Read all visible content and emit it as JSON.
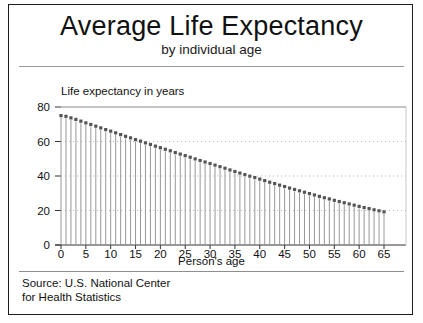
{
  "header": {
    "title": "Average Life Expectancy",
    "subtitle": "by individual age"
  },
  "source_note": "Source: U.S. National Center\nfor Health Statistics",
  "chart_data": {
    "type": "bar",
    "title": "Average Life Expectancy",
    "subtitle": "by individual age",
    "xlabel": "Person's age",
    "ylabel": "Life expectancy in years",
    "xlim": [
      0,
      67
    ],
    "ylim": [
      0,
      80
    ],
    "xticks": [
      0,
      5,
      10,
      15,
      20,
      25,
      30,
      35,
      40,
      45,
      50,
      55,
      60,
      65
    ],
    "yticks": [
      0,
      20,
      40,
      60,
      80
    ],
    "grid": "horizontal-dotted",
    "legend": "none",
    "marker": "square",
    "marker_color": "#555555",
    "line_color": "#8c8c8c",
    "categories": [
      0,
      1,
      2,
      3,
      4,
      5,
      6,
      7,
      8,
      9,
      10,
      11,
      12,
      13,
      14,
      15,
      16,
      17,
      18,
      19,
      20,
      21,
      22,
      23,
      24,
      25,
      26,
      27,
      28,
      29,
      30,
      31,
      32,
      33,
      34,
      35,
      36,
      37,
      38,
      39,
      40,
      41,
      42,
      43,
      44,
      45,
      46,
      47,
      48,
      49,
      50,
      51,
      52,
      53,
      54,
      55,
      56,
      57,
      58,
      59,
      60,
      61,
      62,
      63,
      64,
      65
    ],
    "values": [
      75.0,
      74.6,
      73.7,
      72.8,
      71.8,
      70.8,
      69.9,
      68.9,
      67.9,
      66.9,
      66.0,
      65.0,
      64.0,
      63.0,
      62.1,
      61.1,
      60.2,
      59.2,
      58.3,
      57.3,
      56.4,
      55.5,
      54.6,
      53.6,
      52.7,
      51.8,
      50.9,
      49.9,
      49.0,
      48.1,
      47.2,
      46.3,
      45.4,
      44.5,
      43.5,
      42.6,
      41.7,
      40.8,
      39.9,
      39.1,
      38.2,
      37.3,
      36.4,
      35.6,
      34.7,
      33.9,
      33.0,
      32.2,
      31.4,
      30.6,
      29.8,
      29.0,
      28.2,
      27.4,
      26.7,
      25.9,
      25.2,
      24.5,
      23.8,
      23.1,
      22.4,
      21.7,
      21.1,
      20.4,
      19.8,
      19.2
    ]
  }
}
